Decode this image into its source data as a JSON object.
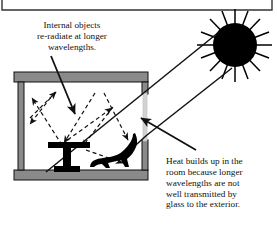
{
  "figure": {
    "frame_color": "#222222",
    "wall_color": "#8a8a8a",
    "wall_outline": "#111111",
    "object_color": "#000000",
    "sun_color": "#000000",
    "ray_color": "#111111",
    "background": "#ffffff"
  },
  "captions": {
    "left": {
      "name": "internal-objects-caption",
      "lines": [
        "Internal objects",
        "re-radiate at longer",
        "wavelengths."
      ]
    },
    "right": {
      "name": "heat-builds-up-caption",
      "lines": [
        "Heat builds up in the",
        "room because longer",
        "wavelengths are not",
        "well transmitted by",
        "glass to the exterior."
      ]
    }
  },
  "elements": {
    "sun": {
      "label": "sun",
      "center_x": 235,
      "center_y": 45,
      "radius": 22,
      "ray_count": 16
    },
    "room": {
      "label": "room-cross-section",
      "x": 14,
      "y": 72,
      "width": 134,
      "height": 108
    },
    "window": {
      "label": "window-glass",
      "x": 143,
      "y": 93,
      "width": 5,
      "height": 48
    },
    "table": {
      "label": "table-silhouette"
    },
    "animal": {
      "label": "animal-silhouette"
    },
    "solar_rays": {
      "label": "incoming-solar-shortwave-rays",
      "style": "solid",
      "count": 2
    },
    "reradiation": {
      "label": "internal-longwave-reradiation-arrows",
      "style": "dashed",
      "count": 8
    },
    "pointer_left": {
      "label": "left-caption-pointer-arrow"
    },
    "pointer_right": {
      "label": "right-caption-pointer-arrow"
    },
    "top_border": {
      "label": "page-frame-border"
    }
  }
}
